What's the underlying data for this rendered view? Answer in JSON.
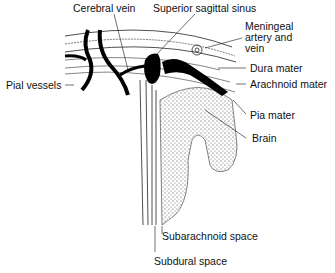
{
  "diagram": {
    "labels": {
      "cerebral_vein": "Cerebral vein",
      "superior_sagittal_sinus": "Superior sagittal sinus",
      "meningeal_line1": "Meningeal",
      "meningeal_line2": "artery and",
      "meningeal_line3": "vein",
      "dura_mater": "Dura mater",
      "arachnoid_mater": "Arachnoid mater",
      "pial_vessels": "Pial vessels",
      "pia_mater": "Pia mater",
      "brain": "Brain",
      "subarachnoid_space": "Subarachnoid space",
      "subdural_space": "Subdural space"
    }
  }
}
